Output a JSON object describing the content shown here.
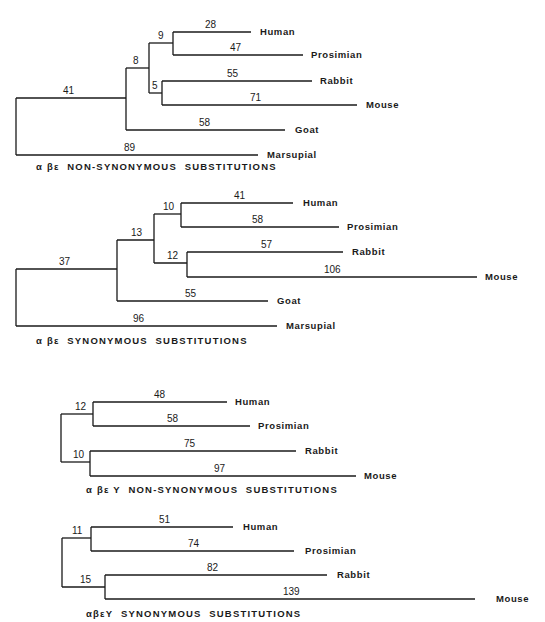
{
  "figure": {
    "type": "phylogenetic-trees",
    "line_color": "#1a1a1a",
    "background": "#ffffff",
    "trees": [
      {
        "caption": "α βε  NON-SYNONYMOUS  SUBSTITUTIONS",
        "caption_pos": [
          36,
          170
        ],
        "branches": [
          {
            "x1": 16,
            "y1": 98,
            "x2": 126,
            "y2": 98,
            "label": "41",
            "lx": 63,
            "ly": 94
          },
          {
            "x1": 126,
            "y1": 68,
            "x2": 149,
            "y2": 68,
            "label": "8",
            "lx": 133,
            "ly": 64
          },
          {
            "x1": 149,
            "y1": 43,
            "x2": 173,
            "y2": 43,
            "label": "9",
            "lx": 158,
            "ly": 39
          },
          {
            "x1": 149,
            "y1": 93,
            "x2": 162,
            "y2": 93,
            "label": "5",
            "lx": 152,
            "ly": 89
          },
          {
            "x1": 173,
            "y1": 32,
            "x2": 251,
            "y2": 32,
            "label": "28",
            "lx": 205,
            "ly": 28
          },
          {
            "x1": 173,
            "y1": 55,
            "x2": 303,
            "y2": 55,
            "label": "47",
            "lx": 230,
            "ly": 51
          },
          {
            "x1": 162,
            "y1": 81,
            "x2": 312,
            "y2": 81,
            "label": "55",
            "lx": 227,
            "ly": 77
          },
          {
            "x1": 162,
            "y1": 105,
            "x2": 357,
            "y2": 105,
            "label": "71",
            "lx": 250,
            "ly": 101
          },
          {
            "x1": 126,
            "y1": 130,
            "x2": 285,
            "y2": 130,
            "label": "58",
            "lx": 199,
            "ly": 126
          },
          {
            "x1": 16,
            "y1": 155,
            "x2": 258,
            "y2": 155,
            "label": "89",
            "lx": 124,
            "ly": 151
          }
        ],
        "verticals": [
          {
            "x": 16,
            "y1": 98,
            "y2": 155
          },
          {
            "x": 126,
            "y1": 68,
            "y2": 130
          },
          {
            "x": 149,
            "y1": 43,
            "y2": 93
          },
          {
            "x": 173,
            "y1": 32,
            "y2": 55
          },
          {
            "x": 162,
            "y1": 81,
            "y2": 105
          }
        ],
        "leaves": [
          {
            "name": "Human",
            "x": 260,
            "y": 35
          },
          {
            "name": "Prosimian",
            "x": 311,
            "y": 58
          },
          {
            "name": "Rabbit",
            "x": 320,
            "y": 84
          },
          {
            "name": "Mouse",
            "x": 366,
            "y": 108
          },
          {
            "name": "Goat",
            "x": 295,
            "y": 133
          },
          {
            "name": "Marsupial",
            "x": 267,
            "y": 158
          }
        ]
      },
      {
        "caption": "α βε  SYNONYMOUS  SUBSTITUTIONS",
        "caption_pos": [
          36,
          344
        ],
        "branches": [
          {
            "x1": 16,
            "y1": 269,
            "x2": 117,
            "y2": 269,
            "label": "37",
            "lx": 59,
            "ly": 265
          },
          {
            "x1": 117,
            "y1": 240,
            "x2": 154,
            "y2": 240,
            "label": "13",
            "lx": 131,
            "ly": 236
          },
          {
            "x1": 154,
            "y1": 214,
            "x2": 181,
            "y2": 214,
            "label": "10",
            "lx": 163,
            "ly": 210
          },
          {
            "x1": 154,
            "y1": 263,
            "x2": 187,
            "y2": 263,
            "label": "12",
            "lx": 167,
            "ly": 259
          },
          {
            "x1": 181,
            "y1": 203,
            "x2": 293,
            "y2": 203,
            "label": "41",
            "lx": 234,
            "ly": 199
          },
          {
            "x1": 181,
            "y1": 227,
            "x2": 339,
            "y2": 227,
            "label": "58",
            "lx": 252,
            "ly": 223
          },
          {
            "x1": 187,
            "y1": 252,
            "x2": 343,
            "y2": 252,
            "label": "57",
            "lx": 261,
            "ly": 248
          },
          {
            "x1": 187,
            "y1": 277,
            "x2": 477,
            "y2": 277,
            "label": "106",
            "lx": 324,
            "ly": 273
          },
          {
            "x1": 117,
            "y1": 301,
            "x2": 268,
            "y2": 301,
            "label": "55",
            "lx": 185,
            "ly": 297
          },
          {
            "x1": 16,
            "y1": 326,
            "x2": 277,
            "y2": 326,
            "label": "96",
            "lx": 133,
            "ly": 322
          }
        ],
        "verticals": [
          {
            "x": 16,
            "y1": 269,
            "y2": 326
          },
          {
            "x": 117,
            "y1": 240,
            "y2": 301
          },
          {
            "x": 154,
            "y1": 214,
            "y2": 263
          },
          {
            "x": 181,
            "y1": 203,
            "y2": 227
          },
          {
            "x": 187,
            "y1": 252,
            "y2": 277
          }
        ],
        "leaves": [
          {
            "name": "Human",
            "x": 303,
            "y": 206
          },
          {
            "name": "Prosimian",
            "x": 347,
            "y": 230
          },
          {
            "name": "Rabbit",
            "x": 352,
            "y": 255
          },
          {
            "name": "Mouse",
            "x": 485,
            "y": 280
          },
          {
            "name": "Goat",
            "x": 277,
            "y": 304
          },
          {
            "name": "Marsupial",
            "x": 286,
            "y": 329
          }
        ]
      },
      {
        "caption": "α βε Υ  NON-SYNONYMOUS  SUBSTITUTIONS",
        "caption_pos": [
          86,
          493
        ],
        "branches": [
          {
            "x1": 61,
            "y1": 414,
            "x2": 93,
            "y2": 414,
            "label": "12",
            "lx": 75,
            "ly": 410
          },
          {
            "x1": 61,
            "y1": 462,
            "x2": 90,
            "y2": 462,
            "label": "10",
            "lx": 73,
            "ly": 458
          },
          {
            "x1": 93,
            "y1": 402,
            "x2": 227,
            "y2": 402,
            "label": "48",
            "lx": 154,
            "ly": 398
          },
          {
            "x1": 93,
            "y1": 426,
            "x2": 250,
            "y2": 426,
            "label": "58",
            "lx": 167,
            "ly": 422
          },
          {
            "x1": 90,
            "y1": 451,
            "x2": 296,
            "y2": 451,
            "label": "75",
            "lx": 184,
            "ly": 447
          },
          {
            "x1": 90,
            "y1": 476,
            "x2": 356,
            "y2": 476,
            "label": "97",
            "lx": 214,
            "ly": 472
          }
        ],
        "verticals": [
          {
            "x": 61,
            "y1": 414,
            "y2": 462
          },
          {
            "x": 93,
            "y1": 402,
            "y2": 426
          },
          {
            "x": 90,
            "y1": 451,
            "y2": 476
          }
        ],
        "leaves": [
          {
            "name": "Human",
            "x": 235,
            "y": 405
          },
          {
            "name": "Prosimian",
            "x": 258,
            "y": 429
          },
          {
            "name": "Rabbit",
            "x": 305,
            "y": 454
          },
          {
            "name": "Mouse",
            "x": 364,
            "y": 479
          }
        ]
      },
      {
        "caption": "αβεΥ  SYNONYMOUS  SUBSTITUTIONS",
        "caption_pos": [
          86,
          617
        ],
        "branches": [
          {
            "x1": 62,
            "y1": 538,
            "x2": 91,
            "y2": 538,
            "label": "11",
            "lx": 72,
            "ly": 534
          },
          {
            "x1": 62,
            "y1": 587,
            "x2": 105,
            "y2": 587,
            "label": "15",
            "lx": 80,
            "ly": 583
          },
          {
            "x1": 91,
            "y1": 527,
            "x2": 233,
            "y2": 527,
            "label": "51",
            "lx": 159,
            "ly": 523
          },
          {
            "x1": 91,
            "y1": 551,
            "x2": 294,
            "y2": 551,
            "label": "74",
            "lx": 188,
            "ly": 547
          },
          {
            "x1": 105,
            "y1": 575,
            "x2": 327,
            "y2": 575,
            "label": "82",
            "lx": 207,
            "ly": 571
          },
          {
            "x1": 105,
            "y1": 599,
            "x2": 475,
            "y2": 599,
            "label": "139",
            "lx": 283,
            "ly": 595
          }
        ],
        "verticals": [
          {
            "x": 62,
            "y1": 538,
            "y2": 587
          },
          {
            "x": 91,
            "y1": 527,
            "y2": 551
          },
          {
            "x": 105,
            "y1": 575,
            "y2": 599
          }
        ],
        "leaves": [
          {
            "name": "Human",
            "x": 243,
            "y": 530
          },
          {
            "name": "Prosimian",
            "x": 305,
            "y": 554
          },
          {
            "name": "Rabbit",
            "x": 337,
            "y": 578
          },
          {
            "name": "Mouse",
            "x": 496,
            "y": 602
          }
        ]
      }
    ]
  }
}
